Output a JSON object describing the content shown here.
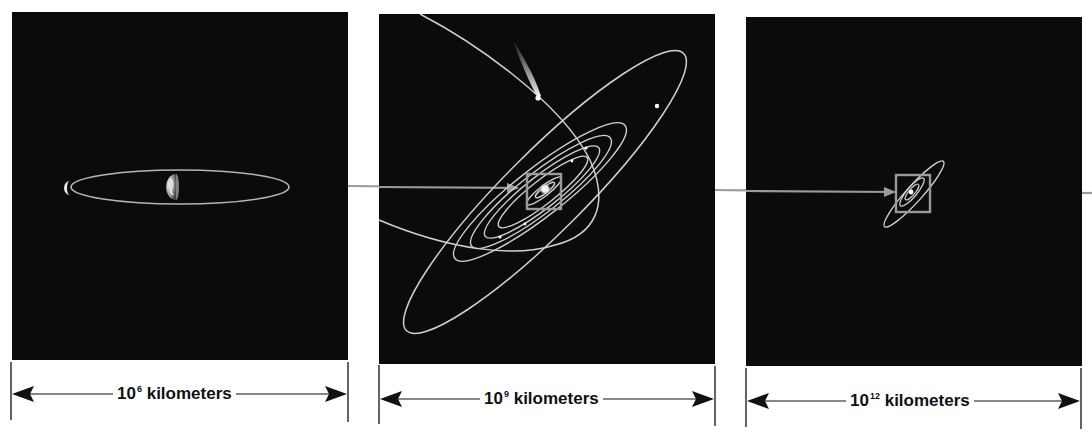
{
  "figure": {
    "colors": {
      "background": "#ffffff",
      "panel": "#0b0b0b",
      "orbit": "#d0d0d0",
      "connector": "#9a9a9a",
      "scale_bar": "#111111"
    }
  },
  "panels": [
    {
      "id": "earth-moon",
      "subject": "Earth and Moon orbit",
      "scale": {
        "base": "10",
        "exponent": "6",
        "unit": "kilometers"
      }
    },
    {
      "id": "solar-system",
      "subject": "Solar System planetary orbits with comet",
      "scale": {
        "base": "10",
        "exponent": "9",
        "unit": "kilometers"
      }
    },
    {
      "id": "distant-solar-system",
      "subject": "Solar System seen from far away",
      "scale": {
        "base": "10",
        "exponent": "12",
        "unit": "kilometers"
      }
    }
  ]
}
